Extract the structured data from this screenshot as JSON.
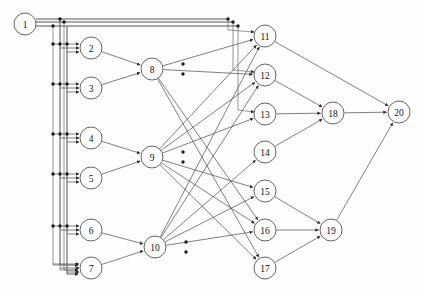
{
  "diagram": {
    "type": "directed-graph",
    "width": 424,
    "height": 294,
    "background_color": "#fdfdfd",
    "edge_color": "#4a4a4a",
    "node_fill": "#ffffff",
    "node_stroke": "#3c3c3c",
    "node_radius": 11,
    "layers": [
      {
        "name": "input",
        "node_ids": [
          1
        ]
      },
      {
        "name": "hidden-a",
        "node_ids": [
          2,
          3,
          4,
          5,
          6,
          7
        ]
      },
      {
        "name": "hidden-b",
        "node_ids": [
          8,
          9,
          10
        ]
      },
      {
        "name": "hidden-c",
        "node_ids": [
          11,
          12,
          13,
          14,
          15,
          16,
          17
        ]
      },
      {
        "name": "hidden-d",
        "node_ids": [
          18,
          19
        ]
      },
      {
        "name": "output",
        "node_ids": [
          20
        ]
      }
    ],
    "nodes": [
      {
        "id": 1,
        "label": "1",
        "x": 25,
        "y": 24,
        "r": 11
      },
      {
        "id": 2,
        "label": "2",
        "x": 91,
        "y": 48,
        "r": 11
      },
      {
        "id": 3,
        "label": "3",
        "x": 91,
        "y": 88,
        "r": 11
      },
      {
        "id": 4,
        "label": "4",
        "x": 91,
        "y": 138,
        "r": 11
      },
      {
        "id": 5,
        "label": "5",
        "x": 91,
        "y": 178,
        "r": 11
      },
      {
        "id": 6,
        "label": "6",
        "x": 91,
        "y": 230,
        "r": 11
      },
      {
        "id": 7,
        "label": "7",
        "x": 91,
        "y": 268,
        "r": 11
      },
      {
        "id": 8,
        "label": "8",
        "x": 152,
        "y": 69,
        "r": 11
      },
      {
        "id": 9,
        "label": "9",
        "x": 152,
        "y": 157,
        "r": 11
      },
      {
        "id": 10,
        "label": "10",
        "x": 155,
        "y": 247,
        "r": 11
      },
      {
        "id": 11,
        "label": "11",
        "x": 265,
        "y": 36,
        "r": 11
      },
      {
        "id": 12,
        "label": "12",
        "x": 265,
        "y": 75,
        "r": 11
      },
      {
        "id": 13,
        "label": "13",
        "x": 265,
        "y": 114,
        "r": 11
      },
      {
        "id": 14,
        "label": "14",
        "x": 265,
        "y": 152,
        "r": 11
      },
      {
        "id": 15,
        "label": "15",
        "x": 265,
        "y": 191,
        "r": 11
      },
      {
        "id": 16,
        "label": "16",
        "x": 265,
        "y": 230,
        "r": 11
      },
      {
        "id": 17,
        "label": "17",
        "x": 265,
        "y": 268,
        "r": 11
      },
      {
        "id": 18,
        "label": "18",
        "x": 333,
        "y": 113,
        "r": 11
      },
      {
        "id": 19,
        "label": "19",
        "x": 331,
        "y": 230,
        "r": 11
      },
      {
        "id": 20,
        "label": "20",
        "x": 399,
        "y": 112,
        "r": 11
      }
    ],
    "edges": [
      {
        "from": 1,
        "to": 2
      },
      {
        "from": 1,
        "to": 3
      },
      {
        "from": 1,
        "to": 4
      },
      {
        "from": 1,
        "to": 5
      },
      {
        "from": 1,
        "to": 6
      },
      {
        "from": 1,
        "to": 7
      },
      {
        "from": 1,
        "to": 11
      },
      {
        "from": 1,
        "to": 12
      },
      {
        "from": 1,
        "to": 13
      },
      {
        "from": 2,
        "to": 8
      },
      {
        "from": 3,
        "to": 8
      },
      {
        "from": 4,
        "to": 9
      },
      {
        "from": 5,
        "to": 9
      },
      {
        "from": 6,
        "to": 10
      },
      {
        "from": 7,
        "to": 10
      },
      {
        "from": 8,
        "to": 11
      },
      {
        "from": 8,
        "to": 12
      },
      {
        "from": 8,
        "to": 16
      },
      {
        "from": 8,
        "to": 17
      },
      {
        "from": 9,
        "to": 11
      },
      {
        "from": 9,
        "to": 12
      },
      {
        "from": 9,
        "to": 13
      },
      {
        "from": 9,
        "to": 15
      },
      {
        "from": 9,
        "to": 16
      },
      {
        "from": 9,
        "to": 17
      },
      {
        "from": 10,
        "to": 11
      },
      {
        "from": 10,
        "to": 12
      },
      {
        "from": 10,
        "to": 14
      },
      {
        "from": 10,
        "to": 15
      },
      {
        "from": 10,
        "to": 16
      },
      {
        "from": 11,
        "to": 20
      },
      {
        "from": 12,
        "to": 18
      },
      {
        "from": 13,
        "to": 18
      },
      {
        "from": 14,
        "to": 18
      },
      {
        "from": 15,
        "to": 19
      },
      {
        "from": 16,
        "to": 19
      },
      {
        "from": 17,
        "to": 19
      },
      {
        "from": 18,
        "to": 20
      },
      {
        "from": 19,
        "to": 20
      }
    ],
    "bus_routes": [
      {
        "id": "bus-1-to-11",
        "points": "36,19 228,19 228,30 254,32"
      },
      {
        "id": "bus-1-to-12",
        "points": "36,22 233,22 233,70 254,72"
      },
      {
        "id": "bus-1-to-13",
        "points": "36,26 238,26 238,110 254,112"
      },
      {
        "id": "bus-1-down-a",
        "points": "60,19 60,265 78,265"
      },
      {
        "id": "bus-1-down-b",
        "points": "64,22 64,270 78,270"
      },
      {
        "id": "bus-1-down-c",
        "points": "67,26 67,274 78,274"
      }
    ],
    "junction_dots": [
      {
        "x": 60,
        "y": 19
      },
      {
        "x": 64,
        "y": 22
      },
      {
        "x": 53,
        "y": 26
      },
      {
        "x": 53,
        "y": 44
      },
      {
        "x": 60,
        "y": 44
      },
      {
        "x": 67,
        "y": 44
      },
      {
        "x": 53,
        "y": 84
      },
      {
        "x": 60,
        "y": 84
      },
      {
        "x": 67,
        "y": 84
      },
      {
        "x": 53,
        "y": 134
      },
      {
        "x": 60,
        "y": 134
      },
      {
        "x": 67,
        "y": 134
      },
      {
        "x": 53,
        "y": 174
      },
      {
        "x": 60,
        "y": 174
      },
      {
        "x": 67,
        "y": 174
      },
      {
        "x": 53,
        "y": 226
      },
      {
        "x": 60,
        "y": 226
      },
      {
        "x": 67,
        "y": 226
      },
      {
        "x": 228,
        "y": 19
      },
      {
        "x": 233,
        "y": 22
      },
      {
        "x": 238,
        "y": 26
      },
      {
        "x": 183,
        "y": 64
      },
      {
        "x": 183,
        "y": 74
      },
      {
        "x": 183,
        "y": 152
      },
      {
        "x": 183,
        "y": 162
      },
      {
        "x": 186,
        "y": 242
      },
      {
        "x": 186,
        "y": 252
      }
    ]
  }
}
